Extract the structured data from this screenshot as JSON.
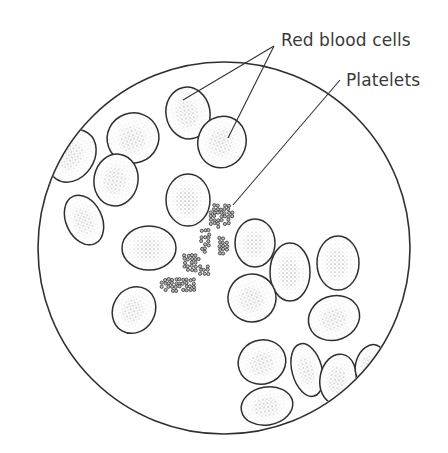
{
  "figure": {
    "labels": {
      "red_blood_cells": "Red blood cells",
      "platelets": "Platelets"
    },
    "colors": {
      "ink": "#2f2f2f",
      "stipple": "#555555",
      "background": "#ffffff"
    },
    "field": {
      "cx": 224,
      "cy": 248,
      "r": 186
    },
    "cells": [
      {
        "cx": 188,
        "cy": 113,
        "rx": 22,
        "ry": 26,
        "rot": -10
      },
      {
        "cx": 222,
        "cy": 142,
        "rx": 24,
        "ry": 26,
        "rot": 20
      },
      {
        "cx": 133,
        "cy": 138,
        "rx": 26,
        "ry": 25,
        "rot": -20
      },
      {
        "cx": 116,
        "cy": 180,
        "rx": 22,
        "ry": 26,
        "rot": 10
      },
      {
        "cx": 72,
        "cy": 156,
        "rx": 22,
        "ry": 28,
        "rot": 35
      },
      {
        "cx": 84,
        "cy": 220,
        "rx": 18,
        "ry": 26,
        "rot": -25
      },
      {
        "cx": 188,
        "cy": 200,
        "rx": 22,
        "ry": 26,
        "rot": 0
      },
      {
        "cx": 149,
        "cy": 248,
        "rx": 27,
        "ry": 22,
        "rot": 0
      },
      {
        "cx": 255,
        "cy": 243,
        "rx": 20,
        "ry": 24,
        "rot": 0
      },
      {
        "cx": 290,
        "cy": 272,
        "rx": 20,
        "ry": 29,
        "rot": 0
      },
      {
        "cx": 338,
        "cy": 263,
        "rx": 21,
        "ry": 27,
        "rot": 0
      },
      {
        "cx": 134,
        "cy": 310,
        "rx": 21,
        "ry": 24,
        "rot": 30
      },
      {
        "cx": 252,
        "cy": 298,
        "rx": 24,
        "ry": 24,
        "rot": -20
      },
      {
        "cx": 334,
        "cy": 318,
        "rx": 26,
        "ry": 22,
        "rot": -20
      },
      {
        "cx": 262,
        "cy": 362,
        "rx": 24,
        "ry": 22,
        "rot": -20
      },
      {
        "cx": 307,
        "cy": 370,
        "rx": 15,
        "ry": 27,
        "rot": -15
      },
      {
        "cx": 338,
        "cy": 379,
        "rx": 18,
        "ry": 25,
        "rot": 10
      },
      {
        "cx": 370,
        "cy": 364,
        "rx": 14,
        "ry": 20,
        "rot": 20
      },
      {
        "cx": 267,
        "cy": 406,
        "rx": 26,
        "ry": 19,
        "rot": -10
      }
    ],
    "leader_lines": [
      {
        "x1": 274,
        "y1": 46,
        "x2": 183,
        "y2": 100
      },
      {
        "x1": 274,
        "y1": 46,
        "x2": 228,
        "y2": 138
      },
      {
        "x1": 340,
        "y1": 80,
        "x2": 233,
        "y2": 205
      }
    ],
    "platelet_clusters": [
      {
        "cx": 220,
        "cy": 215,
        "w": 26,
        "h": 26
      },
      {
        "cx": 205,
        "cy": 240,
        "w": 14,
        "h": 26
      },
      {
        "cx": 222,
        "cy": 245,
        "w": 12,
        "h": 20
      },
      {
        "cx": 192,
        "cy": 262,
        "w": 22,
        "h": 20
      },
      {
        "cx": 178,
        "cy": 285,
        "w": 40,
        "h": 18
      },
      {
        "cx": 203,
        "cy": 270,
        "w": 12,
        "h": 14
      }
    ]
  }
}
